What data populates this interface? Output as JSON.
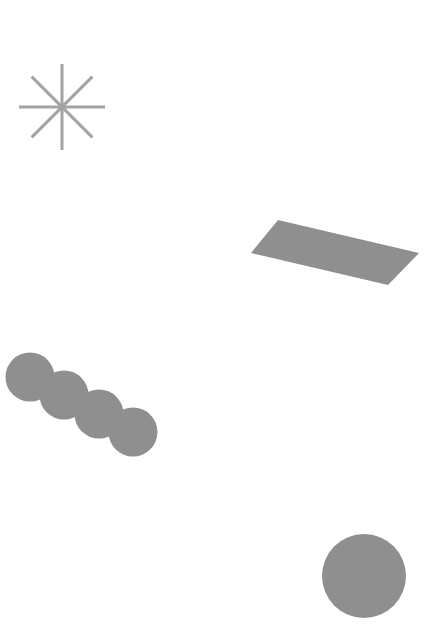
{
  "canvas": {
    "width": 438,
    "height": 629,
    "background": "#ffffff"
  },
  "colors": {
    "shape_fill": "#8f8f8f",
    "star_stroke": "#a3a3a3"
  },
  "shapes": {
    "star": {
      "cx": 62,
      "cy": 107,
      "radius": 43,
      "spokes": 8,
      "stroke_width": 3
    },
    "parallelogram": {
      "points": "278,220 419,253 388,285 251,253"
    },
    "circle_chain": {
      "r": 24.5,
      "circles": [
        {
          "cx": 30,
          "cy": 377
        },
        {
          "cx": 64,
          "cy": 395
        },
        {
          "cx": 99,
          "cy": 414
        },
        {
          "cx": 133,
          "cy": 432
        }
      ]
    },
    "large_circle": {
      "cx": 364,
      "cy": 576,
      "r": 42
    }
  }
}
